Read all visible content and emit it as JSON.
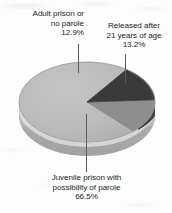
{
  "chart_data": {
    "type": "pie",
    "title": "",
    "subtitle": "",
    "xlabel": "",
    "ylabel": "",
    "legend_position": "none",
    "grid": false,
    "three_d": true,
    "categories": [
      "Juvenile prison with possibility of parole",
      "Released after 21 years of age",
      "Adult prison or no parole"
    ],
    "values": [
      66.5,
      13.2,
      12.9
    ],
    "value_labels": [
      "66.5%",
      "13.2%",
      "12.9%"
    ],
    "units": "percent",
    "slices": [
      {
        "name": "juvenile-prison-parole",
        "label_lines": [
          "Juvenile prison with",
          "possibility of parole"
        ],
        "percent_text": "66.5%",
        "value": 66.5,
        "color": "#b9b9b9",
        "side_color": "#a0a0a0"
      },
      {
        "name": "released-after-21",
        "label_lines": [
          "Released after",
          "21 years of age"
        ],
        "percent_text": "13.2%",
        "value": 13.2,
        "color": "#3a3a3a",
        "side_color": "#2c2c2c"
      },
      {
        "name": "adult-prison-no-parole",
        "label_lines": [
          "Adult prison or",
          "no parole"
        ],
        "percent_text": "12.9%",
        "value": 12.9,
        "color": "#8e8e8e",
        "side_color": "#787878"
      }
    ],
    "colors": {
      "background": "#fdfdfd",
      "text": "#201f1f",
      "leader_line": "#5e5d5d",
      "slice_light": "#b9b9b9",
      "slice_medium": "#8e8e8e",
      "slice_dark": "#3a3a3a",
      "rim_highlight": "#d8d8d8",
      "base_shadow": "#a8a8a8"
    }
  },
  "labels": {
    "adult": {
      "line1": "Adult prison or",
      "line2": "no parole",
      "percent": "12.9%"
    },
    "released": {
      "line1": "Released after",
      "line2": "21 years of age",
      "percent": "13.2%"
    },
    "juvenile": {
      "line1": "Juvenile prison with",
      "line2": "possibility of parole",
      "percent": "66.5%"
    }
  }
}
